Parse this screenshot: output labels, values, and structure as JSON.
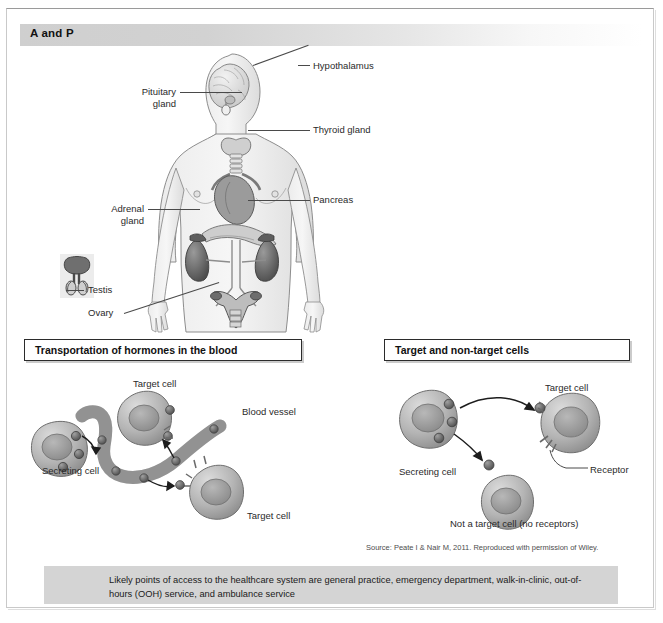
{
  "header": {
    "title": "A and P"
  },
  "anatomy": {
    "labels": [
      {
        "id": "hypothalamus",
        "text": "Hypothalamus"
      },
      {
        "id": "thyroid-gland",
        "text": "Thyroid gland"
      },
      {
        "id": "pancreas",
        "text": "Pancreas"
      },
      {
        "id": "pituitary-gland",
        "line1": "Pituitary",
        "line2": "gland"
      },
      {
        "id": "adrenal-gland",
        "line1": "Adrenal",
        "line2": "gland"
      },
      {
        "id": "testis",
        "text": "Testis"
      },
      {
        "id": "ovary",
        "text": "Ovary"
      }
    ]
  },
  "panels": {
    "left": {
      "title": "Transportation of hormones in the blood",
      "labels": {
        "secreting_cell": "Secreting cell",
        "target_cell_top": "Target cell",
        "target_cell_bottom": "Target cell",
        "blood_vessel": "Blood vessel"
      }
    },
    "right": {
      "title": "Target and non-target cells",
      "labels": {
        "secreting_cell": "Secreting cell",
        "target_cell": "Target cell",
        "receptor": "Receptor",
        "non_target_cell": "Not a target cell (no receptors)"
      }
    }
  },
  "source": "Source: Peate I & Nair M, 2011. Reproduced with permission of Wiley.",
  "banner": {
    "text": "Likely points of access to the healthcare system are general practice, emergency department, walk-in-clinic, out-of-hours (OOH) service, and ambulance service"
  },
  "colors": {
    "banner_bg": "#d4d4d4",
    "header_gradient_start": "#cfcfcf",
    "header_gradient_end": "#ffffff",
    "ink": "#1d1d1d",
    "cell_fill": "#a8a8a8",
    "vessel_fill": "#9b9b9b"
  }
}
